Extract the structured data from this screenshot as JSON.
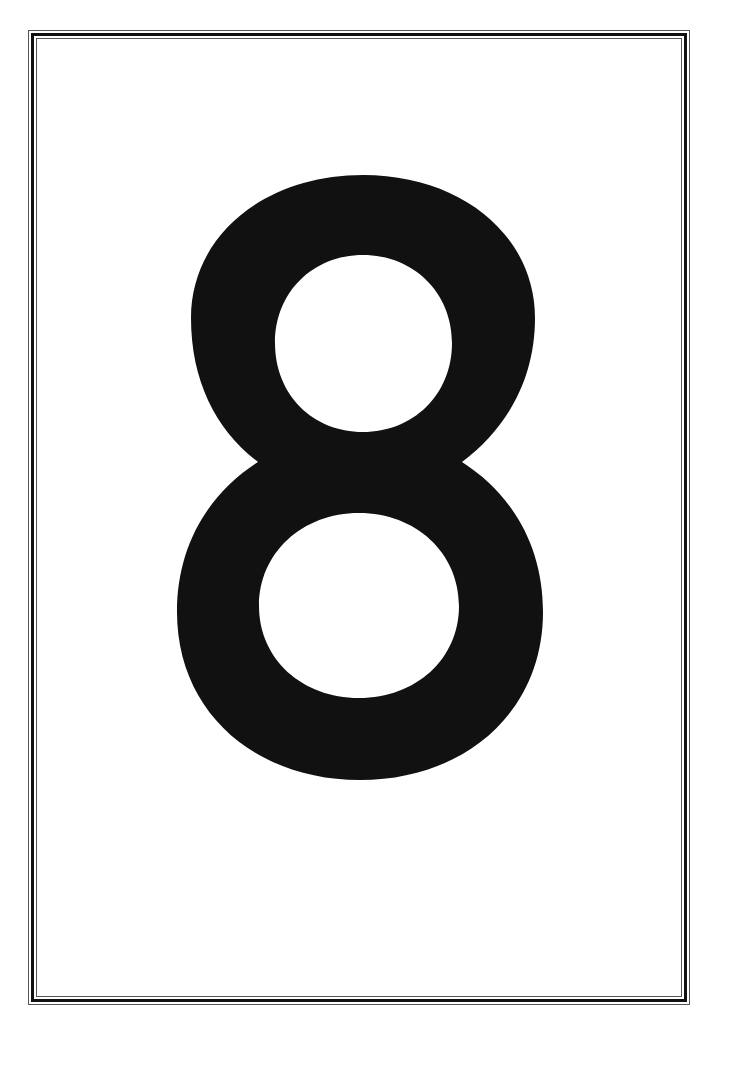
{
  "card": {
    "numeral": "8",
    "numeral_color": "#111111",
    "background_color": "#ffffff",
    "border_style": "double-line frame"
  }
}
